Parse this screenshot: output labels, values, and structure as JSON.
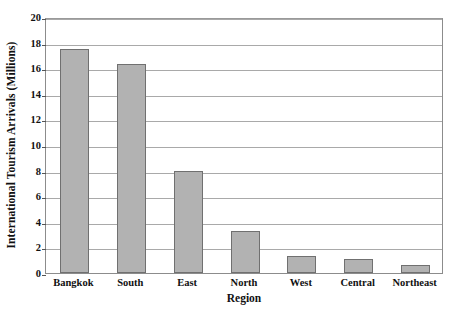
{
  "chart_data": {
    "type": "bar",
    "title": "",
    "xlabel": "Region",
    "ylabel": "International Tourism Arrivals (Millions)",
    "categories": [
      "Bangkok",
      "South",
      "East",
      "North",
      "West",
      "Central",
      "Northeast"
    ],
    "values": [
      17.5,
      16.3,
      8.0,
      3.3,
      1.3,
      1.1,
      0.6
    ],
    "ylim": [
      0,
      20
    ],
    "ytick_labels": [
      "0",
      "2",
      "4",
      "6",
      "8",
      "10",
      "12",
      "14",
      "16",
      "18",
      "20"
    ],
    "ytick_values": [
      0,
      2,
      4,
      6,
      8,
      10,
      12,
      14,
      16,
      18,
      20
    ],
    "grid": true,
    "legend": false,
    "legend_position": "none",
    "bar_fill_color": "#b2b2b2",
    "bar_border_color": "#707070",
    "gridline_color": "#a9a9a9",
    "axis_color": "#8c8c8c",
    "background_color": "#ffffff"
  }
}
